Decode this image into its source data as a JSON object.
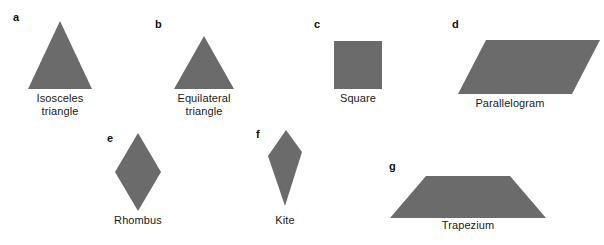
{
  "figure": {
    "background_color": "#ffffff",
    "shape_fill_color": "#6b6b6b",
    "label_color": "#111111",
    "caption_color": "#1a1a1a"
  },
  "shapes": [
    {
      "tag": "a",
      "caption": "Isosceles\ntriangle",
      "kind": "isosceles-triangle",
      "tag_x": 13,
      "tag_y": 12,
      "box_x": 28,
      "box_y": 21,
      "box_w": 64,
      "box_h": 68,
      "points": "32,0 0,68 64,68",
      "caption_x": 20,
      "caption_y": 92,
      "caption_w": 80
    },
    {
      "tag": "b",
      "caption": "Equilateral\ntriangle",
      "kind": "equilateral-triangle",
      "tag_x": 155,
      "tag_y": 19,
      "box_x": 174,
      "box_y": 36,
      "box_w": 60,
      "box_h": 53,
      "points": "30,0 0,53 60,53",
      "caption_x": 164,
      "caption_y": 92,
      "caption_w": 80
    },
    {
      "tag": "c",
      "caption": "Square",
      "kind": "square",
      "tag_x": 314,
      "tag_y": 19,
      "box_x": 334,
      "box_y": 41,
      "box_w": 48,
      "box_h": 48,
      "points": "0,0 48,0 48,48 0,48",
      "caption_x": 318,
      "caption_y": 92,
      "caption_w": 80
    },
    {
      "tag": "d",
      "caption": "Parallelogram",
      "kind": "parallelogram",
      "tag_x": 452,
      "tag_y": 19,
      "box_x": 458,
      "box_y": 40,
      "box_w": 142,
      "box_h": 54,
      "points": "28,0 142,0 114,54 0,54",
      "caption_x": 450,
      "caption_y": 97,
      "caption_w": 120
    },
    {
      "tag": "e",
      "caption": "Rhombus",
      "kind": "rhombus",
      "tag_x": 107,
      "tag_y": 133,
      "box_x": 115,
      "box_y": 133,
      "box_w": 46,
      "box_h": 78,
      "points": "23,0 46,39 23,78 0,39",
      "caption_x": 98,
      "caption_y": 214,
      "caption_w": 80
    },
    {
      "tag": "f",
      "caption": "Kite",
      "kind": "kite",
      "tag_x": 256,
      "tag_y": 129,
      "box_x": 268,
      "box_y": 130,
      "box_w": 34,
      "box_h": 76,
      "points": "18,0 34,22 17,76 0,26",
      "caption_x": 245,
      "caption_y": 214,
      "caption_w": 80
    },
    {
      "tag": "g",
      "caption": "Trapezium",
      "kind": "trapezium",
      "tag_x": 389,
      "tag_y": 161,
      "box_x": 390,
      "box_y": 176,
      "box_w": 156,
      "box_h": 42,
      "points": "36,0 120,0 156,42 0,42",
      "caption_x": 428,
      "caption_y": 219,
      "caption_w": 80
    }
  ]
}
